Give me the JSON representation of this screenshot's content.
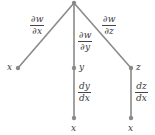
{
  "diagram": {
    "type": "chain-rule-tree",
    "line_color": "#8a8a8a",
    "node_color": "#8a8a8a",
    "nodes": {
      "root": {
        "label": "",
        "x": 74,
        "y": 3
      },
      "x_mid": {
        "label": "x",
        "x": 18,
        "y": 68
      },
      "y_mid": {
        "label": "y",
        "x": 74,
        "y": 68
      },
      "z_mid": {
        "label": "z",
        "x": 131,
        "y": 68
      },
      "y_bottom": {
        "label": "x",
        "x": 74,
        "y": 118
      },
      "z_bottom": {
        "label": "x",
        "x": 131,
        "y": 118
      }
    },
    "edges": {
      "root_x": {
        "num": "∂w",
        "den": "∂x"
      },
      "root_y": {
        "num": "∂w",
        "den": "∂y"
      },
      "root_z": {
        "num": "∂w",
        "den": "∂z"
      },
      "y_x": {
        "num": "dy",
        "den": "dx"
      },
      "z_x": {
        "num": "dz",
        "den": "dx"
      }
    }
  }
}
